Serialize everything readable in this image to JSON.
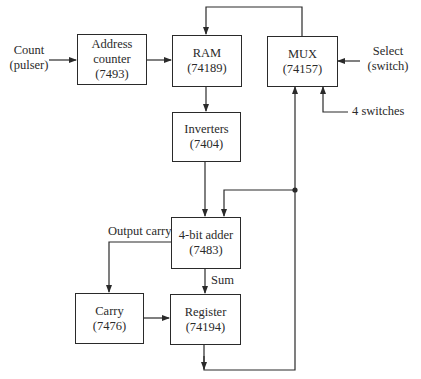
{
  "diagram": {
    "type": "block-diagram",
    "blocks": {
      "address_counter": {
        "line1": "Address",
        "line2": "counter",
        "part": "(7493)"
      },
      "ram": {
        "line1": "RAM",
        "part": "(74189)"
      },
      "mux": {
        "line1": "MUX",
        "part": "(74157)"
      },
      "inverters": {
        "line1": "Inverters",
        "part": "(7404)"
      },
      "adder": {
        "line1": "4-bit adder",
        "part": "(7483)"
      },
      "carry": {
        "line1": "Carry",
        "part": "(7476)"
      },
      "register": {
        "line1": "Register",
        "part": "(74194)"
      }
    },
    "inputs": {
      "count": {
        "line1": "Count",
        "line2": "(pulser)"
      },
      "select": {
        "line1": "Select",
        "line2": "(switch)"
      },
      "switches": {
        "label": "4 switches"
      }
    },
    "signal_labels": {
      "output_carry": "Output carry",
      "sum": "Sum"
    },
    "connections": [
      {
        "from": "Count (pulser)",
        "to": "Address counter"
      },
      {
        "from": "Address counter",
        "to": "RAM"
      },
      {
        "from": "MUX",
        "to": "RAM"
      },
      {
        "from": "RAM",
        "to": "Inverters"
      },
      {
        "from": "Inverters",
        "to": "4-bit adder"
      },
      {
        "from": "Register",
        "to": "4-bit adder"
      },
      {
        "from": "Register",
        "to": "MUX"
      },
      {
        "from": "Select (switch)",
        "to": "MUX"
      },
      {
        "from": "4 switches",
        "to": "MUX"
      },
      {
        "from": "4-bit adder",
        "to": "Carry",
        "label": "Output carry"
      },
      {
        "from": "4-bit adder",
        "to": "Register",
        "label": "Sum"
      },
      {
        "from": "Carry",
        "to": "Register"
      }
    ],
    "colors": {
      "line": "#2a2a2a",
      "background": "#ffffff"
    }
  }
}
